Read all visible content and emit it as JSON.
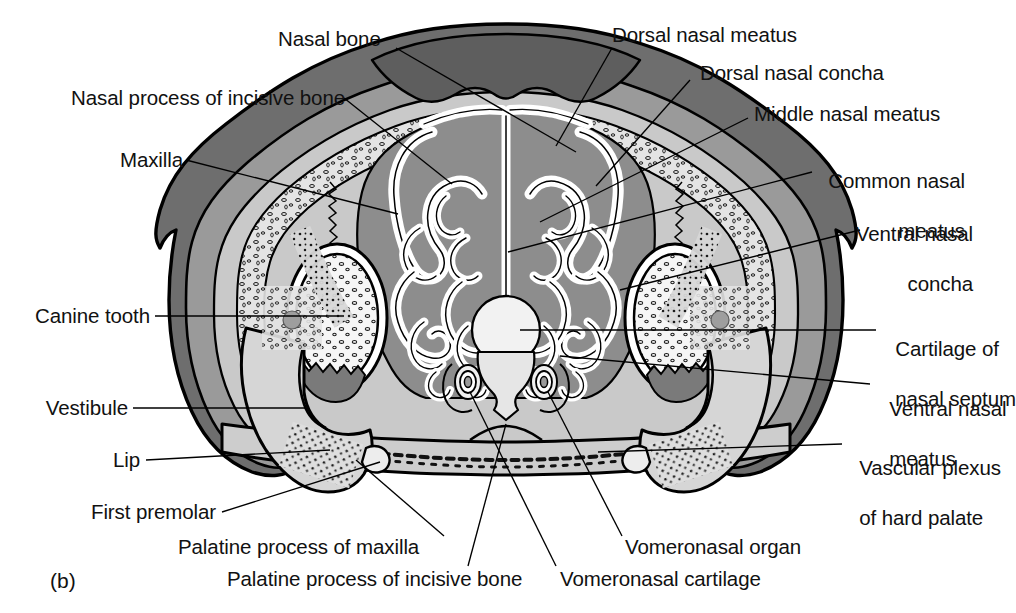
{
  "figure": {
    "panel_id": "(b)",
    "type": "anatomical-cross-section"
  },
  "colors": {
    "background": "#ffffff",
    "outline": "#000000",
    "skin_dark": "#6e6e6e",
    "tissue_mid": "#9a9a9a",
    "tissue_light": "#c9c9c9",
    "bone_light": "#dcdcdc",
    "mucosa": "#8d8d8d",
    "cavity_white": "#f4f4f4",
    "septum_cartilage": "#e9e9e9",
    "text": "#111111"
  },
  "labels": {
    "left": [
      {
        "id": "nasal-process-of-incisive-bone",
        "text": "Nasal process of incisive bone"
      },
      {
        "id": "maxilla",
        "text": "Maxilla"
      },
      {
        "id": "canine-tooth",
        "text": "Canine tooth"
      },
      {
        "id": "vestibule",
        "text": "Vestibule"
      },
      {
        "id": "lip",
        "text": "Lip"
      },
      {
        "id": "first-premolar",
        "text": "First premolar"
      }
    ],
    "top": [
      {
        "id": "nasal-bone",
        "text": "Nasal bone"
      },
      {
        "id": "dorsal-nasal-meatus",
        "text": "Dorsal nasal meatus"
      },
      {
        "id": "dorsal-nasal-concha",
        "text": "Dorsal nasal concha"
      },
      {
        "id": "middle-nasal-meatus",
        "text": "Middle nasal meatus"
      }
    ],
    "right": [
      {
        "id": "common-nasal-meatus",
        "line1": "Common nasal",
        "line2": "meatus"
      },
      {
        "id": "ventral-nasal-concha",
        "line1": "Ventral nasal",
        "line2": "concha"
      },
      {
        "id": "cartilage-of-nasal-septum",
        "line1": "Cartilage of",
        "line2": "nasal septum"
      },
      {
        "id": "ventral-nasal-meatus",
        "line1": "Ventral nasal",
        "line2": "meatus"
      },
      {
        "id": "vascular-plexus-of-hard-palate",
        "line1": "Vascular plexus",
        "line2": "of hard palate"
      }
    ],
    "bottom": [
      {
        "id": "palatine-process-of-maxilla",
        "text": "Palatine process of maxilla"
      },
      {
        "id": "palatine-process-of-incisive-bone",
        "text": "Palatine process of incisive bone"
      },
      {
        "id": "vomeronasal-organ",
        "text": "Vomeronasal organ"
      },
      {
        "id": "vomeronasal-cartilage",
        "text": "Vomeronasal cartilage"
      }
    ]
  }
}
